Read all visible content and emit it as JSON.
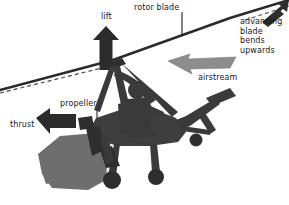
{
  "figure": {
    "background_color": "#ffffff",
    "width": 289,
    "height": 205
  },
  "labels": {
    "rotor_blade": "rotor blade",
    "lift": "lift",
    "advancing_blade": "advancing\nblade bends\nupwards",
    "airstream": "airstream",
    "propeller": "propeller",
    "thrust": "thrust"
  },
  "icons": {
    "lift_arrow": "arrow-up-icon",
    "thrust_arrow": "arrow-left-icon",
    "airstream_arrow": "arrow-left-swept-icon",
    "advancing_blade_arrow": "arrow-up-right-icon",
    "rotor_disc_line": "rotor-disc-line",
    "rotor_disc_reference_line": "dashed-reference-line",
    "aircraft": "gyrocopter-silhouette",
    "pilot": "pilot-silhouette",
    "propeller_blades": "propeller-icon",
    "ground_shadow": "ground-shadow-shape"
  },
  "colors": {
    "ink": "#1a1a1a",
    "body_dark": "#3a3a3a",
    "body_mid": "#4a4a4a",
    "gray_mid": "#6e6e6e",
    "gray_light": "#8c8c8c",
    "gray_arrow": "#7d7d7d",
    "background": "#ffffff"
  },
  "annotations": {
    "lift_direction": "up",
    "thrust_direction": "left",
    "airstream_direction": "left",
    "advancing_blade_direction": "up-right",
    "rotor_tilt_note": "rotor disc tilted rearward, rising left to right"
  }
}
